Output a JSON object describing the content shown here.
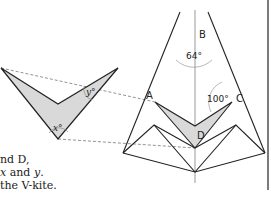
{
  "figure": {
    "points": {
      "A": "A",
      "B": "B",
      "C": "C",
      "D": "D"
    },
    "angles": {
      "at_B": "64°",
      "at_C": "100°"
    },
    "v_kite_labels": {
      "x": "x°",
      "y": "y°"
    },
    "colors": {
      "stroke": "#222222",
      "fill": "#d9d9d9",
      "axis": "#999999",
      "dashed": "#777777"
    }
  },
  "caption": {
    "line1": "nd D,",
    "line2_pre": "x",
    "line2_mid": " and ",
    "line2_var": "y",
    "line2_end": ".",
    "line3": "the V-kite."
  }
}
